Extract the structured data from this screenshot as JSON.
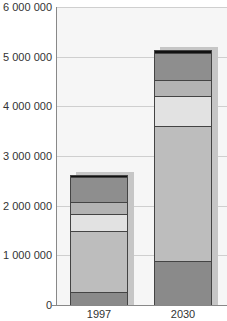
{
  "chart_data": {
    "type": "bar",
    "stacked": true,
    "title": "",
    "xlabel": "",
    "ylabel": "",
    "categories": [
      "1997",
      "2030"
    ],
    "ylim": [
      0,
      6000000
    ],
    "yticks": [
      "0",
      "1 000 000",
      "2 000 000",
      "3 000 000",
      "4 000 000",
      "5 000 000",
      "6 000 000"
    ],
    "grid": true,
    "legend": "none",
    "series": [
      {
        "name": "segment 1 (bottom)",
        "color": "#8a8a8a",
        "values": [
          260000,
          880000
        ]
      },
      {
        "name": "segment 2",
        "color": "#bdbdbd",
        "values": [
          1230000,
          2720000
        ]
      },
      {
        "name": "segment 3",
        "color": "#e2e2e2",
        "values": [
          340000,
          600000
        ]
      },
      {
        "name": "segment 4",
        "color": "#b3b3b3",
        "values": [
          240000,
          330000
        ]
      },
      {
        "name": "segment 5",
        "color": "#8e8e8e",
        "values": [
          510000,
          540000
        ]
      },
      {
        "name": "segment 6 (top)",
        "color": "#111111",
        "values": [
          40000,
          60000
        ]
      }
    ],
    "totals": [
      2620000,
      5130000
    ]
  }
}
